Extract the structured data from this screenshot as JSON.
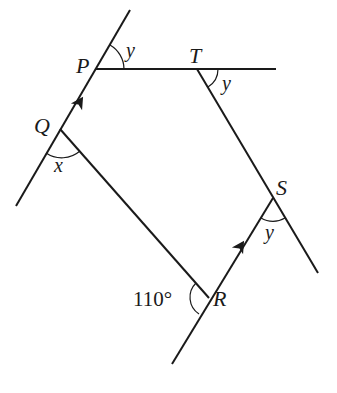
{
  "diagram": {
    "type": "geometry",
    "points": {
      "P": {
        "label": "P"
      },
      "Q": {
        "label": "Q"
      },
      "R": {
        "label": "R"
      },
      "S": {
        "label": "S"
      },
      "T": {
        "label": "T"
      }
    },
    "angles": {
      "at_P": "y",
      "at_T": "y",
      "at_S": "y",
      "at_Q": "x",
      "at_R": "110°"
    },
    "parallel_marks": [
      "PQ",
      "RS"
    ]
  }
}
